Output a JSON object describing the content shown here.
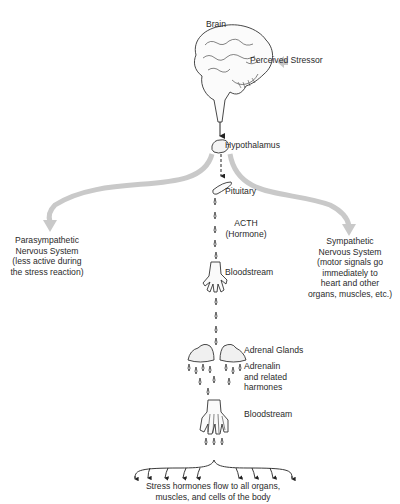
{
  "diagram": {
    "nodes": {
      "brain": "Brain",
      "perceived_stressor": "Perceived Stressor",
      "hypothalamus": "Hypothalamus",
      "pituitary": "Pituitary",
      "acth": [
        "ACTH",
        "(Hormone)"
      ],
      "bloodstream_1": "Bloodstream",
      "adrenal_glands": "Adrenal Glands",
      "adrenalin": [
        "Adrenalin",
        "and related",
        "harmones"
      ],
      "bloodstream_2": "Bloodstream",
      "parasympathetic": [
        "Parasympathetic",
        "Nervous System",
        "(less active during",
        "the stress reaction)"
      ],
      "sympathetic": [
        "Sympathetic",
        "Nervous System",
        "(motor signals go",
        "immediately to",
        "heart and other",
        "organs, muscles, etc.)"
      ],
      "outcome": [
        "Stress hormones flow to all organs,",
        "muscles, and cells of the body"
      ]
    },
    "edges": [
      {
        "from": "perceived_stressor",
        "to": "brain",
        "style": "gray-block-arrow"
      },
      {
        "from": "brain",
        "to": "hypothalamus",
        "style": "solid-arrow"
      },
      {
        "from": "hypothalamus",
        "to": "pituitary",
        "style": "dashed-arrow"
      },
      {
        "from": "hypothalamus",
        "to": "parasympathetic",
        "style": "gray-curved-arrow"
      },
      {
        "from": "hypothalamus",
        "to": "sympathetic",
        "style": "gray-curved-arrow"
      },
      {
        "from": "pituitary",
        "to": "bloodstream_1",
        "style": "droplets"
      },
      {
        "from": "bloodstream_1",
        "to": "adrenal_glands",
        "style": "droplets"
      },
      {
        "from": "adrenal_glands",
        "to": "bloodstream_2",
        "style": "droplets"
      },
      {
        "from": "bloodstream_2",
        "to": "outcome",
        "style": "brace-arrows"
      }
    ],
    "colors": {
      "ink": "#2a2a2a",
      "gray_arrow": "#c8c8c8"
    }
  }
}
